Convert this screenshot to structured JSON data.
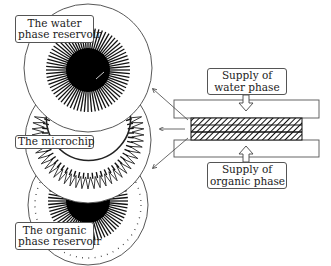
{
  "diagram": {
    "labels": {
      "water_reservoir": {
        "line1": "The water",
        "line2": "phase reservoir"
      },
      "microchip": {
        "line1": "The microchip"
      },
      "organic_reservoir": {
        "line1": "The organic",
        "line2": "phase reservoir"
      },
      "supply_water": {
        "line1": "Supply of",
        "line2": "water phase"
      },
      "supply_organic": {
        "line1": "Supply of",
        "line2": "organic phase"
      }
    },
    "components": [
      {
        "id": "water-phase-reservoir",
        "shape": "circle-disc",
        "center": [
          88,
          68
        ],
        "radius": 64
      },
      {
        "id": "microchip",
        "shape": "circle-disc",
        "center": [
          88,
          140
        ],
        "radius": 63
      },
      {
        "id": "organic-phase-reservoir",
        "shape": "circle-disc",
        "center": [
          88,
          205
        ],
        "radius": 60
      },
      {
        "id": "top-plate",
        "shape": "rect"
      },
      {
        "id": "membrane-layer",
        "shape": "hatched-rect"
      },
      {
        "id": "bottom-plate",
        "shape": "rect"
      }
    ],
    "arrows": [
      {
        "from": "membrane-layer",
        "to": "water-phase-reservoir"
      },
      {
        "from": "membrane-layer",
        "to": "microchip"
      },
      {
        "from": "membrane-layer",
        "to": "organic-phase-reservoir"
      },
      {
        "from": "supply-water",
        "to": "top-plate",
        "style": "hollow"
      },
      {
        "from": "supply-organic",
        "to": "bottom-plate",
        "style": "hollow"
      }
    ],
    "colors": {
      "line": "#333333",
      "fill": "#ffffff",
      "dark": "#000000"
    }
  }
}
